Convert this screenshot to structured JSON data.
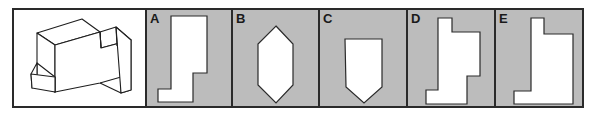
{
  "question": {
    "description": "Isometric drawing of a 3D block object",
    "icon": "isometric-solid-figure"
  },
  "options": [
    {
      "label": "A",
      "shape": "stepped-L-profile"
    },
    {
      "label": "B",
      "shape": "elongated-hexagon"
    },
    {
      "label": "C",
      "shape": "pentagon-shield"
    },
    {
      "label": "D",
      "shape": "double-stepped-profile"
    },
    {
      "label": "E",
      "shape": "stepped-L-profile-notched"
    }
  ],
  "colors": {
    "option_background": "#bcbcbc",
    "shape_fill": "#ffffff",
    "stroke": "#2a2a2a"
  }
}
